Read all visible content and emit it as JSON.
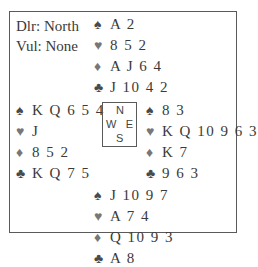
{
  "deal_info": {
    "dealer": "Dlr: North",
    "vulnerability": "Vul: None"
  },
  "suit_icons": {
    "spades": "♠",
    "hearts": "♥",
    "diamonds": "♦",
    "clubs": "♣"
  },
  "hands": {
    "north": {
      "spades": "A 2",
      "hearts": "8 5 2",
      "diamonds": "A J 6 4",
      "clubs": "J 10 4 2"
    },
    "west": {
      "spades": "K Q 6 5 4",
      "hearts": "J",
      "diamonds": "8 5 2",
      "clubs": "K Q 7 5"
    },
    "east": {
      "spades": "8 3",
      "hearts": "K Q 10 9 6 3",
      "diamonds": "K 7",
      "clubs": "9 6 3"
    },
    "south": {
      "spades": "J 10 9 7",
      "hearts": "A 7 4",
      "diamonds": "Q 10 9 3",
      "clubs": "A 8"
    }
  },
  "compass": {
    "n": "N",
    "w": "W",
    "e": "E",
    "s": "S"
  }
}
